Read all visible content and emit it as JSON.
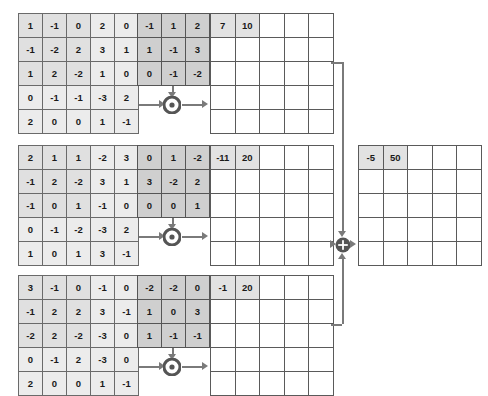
{
  "diagram": {
    "colors": {
      "input_cell": "#ececec",
      "input_highlight": "#e0e0e0",
      "kernel_cell": "#cfcfcf",
      "output_cell": "#ffffff",
      "output_highlight": "#e2e2e2",
      "wire": "#7a7a7a",
      "node_fill": "#555555",
      "text": "#1a1a1a"
    },
    "operators": {
      "conv_symbol": "*",
      "conv_name": "convolution-operator",
      "sum_symbol": "+",
      "sum_name": "summation-operator"
    },
    "channels": [
      {
        "name": "channel-1",
        "input": {
          "rows": 5,
          "cols": 5,
          "values": [
            [
              "1",
              "-1",
              "0",
              "2",
              "0"
            ],
            [
              "-1",
              "-2",
              "2",
              "3",
              "1"
            ],
            [
              "1",
              "2",
              "-2",
              "1",
              "0"
            ],
            [
              "0",
              "-1",
              "-1",
              "-3",
              "2"
            ],
            [
              "2",
              "0",
              "0",
              "1",
              "-1"
            ]
          ],
          "highlight": {
            "row0": 0,
            "col0": 0,
            "rows": 3,
            "cols": 3
          }
        },
        "kernel": {
          "rows": 3,
          "cols": 3,
          "values": [
            [
              "-1",
              "1",
              "2"
            ],
            [
              "1",
              "-1",
              "3"
            ],
            [
              "0",
              "-1",
              "-2"
            ]
          ]
        },
        "output": {
          "rows": 5,
          "cols": 5,
          "values": [
            [
              "7",
              "10",
              "",
              "",
              ""
            ],
            [
              "",
              "",
              "",
              "",
              ""
            ],
            [
              "",
              "",
              "",
              "",
              ""
            ],
            [
              "",
              "",
              "",
              "",
              ""
            ],
            [
              "",
              "",
              "",
              "",
              ""
            ]
          ],
          "highlight": {
            "row0": 0,
            "col0": 0,
            "rows": 1,
            "cols": 2
          }
        }
      },
      {
        "name": "channel-2",
        "input": {
          "rows": 5,
          "cols": 5,
          "values": [
            [
              "2",
              "1",
              "1",
              "-2",
              "3"
            ],
            [
              "-1",
              "2",
              "-2",
              "3",
              "1"
            ],
            [
              "-1",
              "0",
              "1",
              "-1",
              "0"
            ],
            [
              "0",
              "-1",
              "-2",
              "-3",
              "2"
            ],
            [
              "1",
              "0",
              "1",
              "3",
              "-1"
            ]
          ],
          "highlight": {
            "row0": 0,
            "col0": 0,
            "rows": 3,
            "cols": 3
          }
        },
        "kernel": {
          "rows": 3,
          "cols": 3,
          "values": [
            [
              "0",
              "1",
              "-2"
            ],
            [
              "3",
              "-2",
              "2"
            ],
            [
              "0",
              "0",
              "1"
            ]
          ]
        },
        "output": {
          "rows": 5,
          "cols": 5,
          "values": [
            [
              "-11",
              "20",
              "",
              "",
              ""
            ],
            [
              "",
              "",
              "",
              "",
              ""
            ],
            [
              "",
              "",
              "",
              "",
              ""
            ],
            [
              "",
              "",
              "",
              "",
              ""
            ],
            [
              "",
              "",
              "",
              "",
              ""
            ]
          ],
          "highlight": {
            "row0": 0,
            "col0": 0,
            "rows": 1,
            "cols": 2
          }
        }
      },
      {
        "name": "channel-3",
        "input": {
          "rows": 5,
          "cols": 5,
          "values": [
            [
              "3",
              "-1",
              "0",
              "-1",
              "0"
            ],
            [
              "-1",
              "2",
              "2",
              "3",
              "-1"
            ],
            [
              "-2",
              "2",
              "-2",
              "-3",
              "0"
            ],
            [
              "0",
              "-1",
              "2",
              "-3",
              "0"
            ],
            [
              "2",
              "0",
              "0",
              "1",
              "-1"
            ]
          ],
          "highlight": {
            "row0": 0,
            "col0": 0,
            "rows": 3,
            "cols": 3
          }
        },
        "kernel": {
          "rows": 3,
          "cols": 3,
          "values": [
            [
              "-2",
              "-2",
              "0"
            ],
            [
              "1",
              "0",
              "3"
            ],
            [
              "1",
              "-1",
              "-1"
            ]
          ]
        },
        "output": {
          "rows": 5,
          "cols": 5,
          "values": [
            [
              "-1",
              "20",
              "",
              "",
              ""
            ],
            [
              "",
              "",
              "",
              "",
              ""
            ],
            [
              "",
              "",
              "",
              "",
              ""
            ],
            [
              "",
              "",
              "",
              "",
              ""
            ],
            [
              "",
              "",
              "",
              "",
              ""
            ]
          ],
          "highlight": {
            "row0": 0,
            "col0": 0,
            "rows": 1,
            "cols": 2
          }
        }
      }
    ],
    "final_output": {
      "name": "final-output-matrix",
      "rows": 5,
      "cols": 5,
      "values": [
        [
          "-5",
          "50",
          "",
          "",
          ""
        ],
        [
          "",
          "",
          "",
          "",
          ""
        ],
        [
          "",
          "",
          "",
          "",
          ""
        ],
        [
          "",
          "",
          "",
          "",
          ""
        ],
        [
          "",
          "",
          "",
          "",
          ""
        ]
      ],
      "highlight": {
        "row0": 0,
        "col0": 0,
        "rows": 1,
        "cols": 2
      }
    }
  }
}
